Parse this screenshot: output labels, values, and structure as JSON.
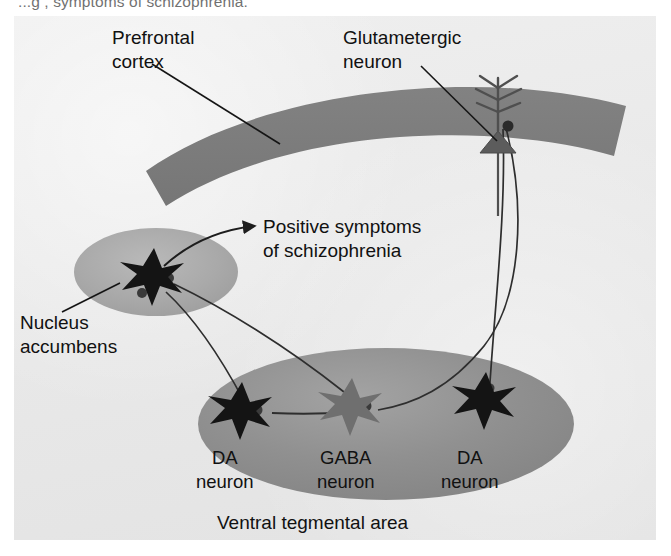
{
  "caption": {
    "clipped_line": "...g           , symptoms of schizophrenia."
  },
  "figure": {
    "labels": {
      "prefrontal_cortex": [
        "Prefrontal",
        "cortex"
      ],
      "glutametergic_neuron": [
        "Glutametergic",
        "neuron"
      ],
      "positive_symptoms": [
        "Positive symptoms",
        "of schizophrenia"
      ],
      "nucleus_accumbens": [
        "Nucleus",
        "accumbens"
      ],
      "da_neuron_left": [
        "DA",
        "neuron"
      ],
      "gaba_neuron": [
        "GABA",
        "neuron"
      ],
      "da_neuron_right": [
        "DA",
        "neuron"
      ],
      "ventral_tegmental_area": "Ventral tegmental area"
    },
    "structures": [
      {
        "name": "prefrontal-cortex-band",
        "kind": "curved-band",
        "fill": "#7d7d7d"
      },
      {
        "name": "nucleus-accumbens-ellipse",
        "kind": "ellipse",
        "fill": "#a8a8a8"
      },
      {
        "name": "ventral-tegmental-area-ellipse",
        "kind": "ellipse",
        "fill": "#8f8f8f"
      }
    ],
    "neurons": [
      {
        "name": "glutametergic-pyramidal-neuron",
        "shape": "triangle-with-dendrites",
        "fill": "#5a5a5a",
        "region": "prefrontal cortex"
      },
      {
        "name": "accumbens-star-neuron",
        "shape": "star",
        "fill": "#141414",
        "region": "nucleus accumbens"
      },
      {
        "name": "da-neuron-left-star",
        "shape": "star",
        "fill": "#141414",
        "region": "ventral tegmental area"
      },
      {
        "name": "gaba-neuron-star",
        "shape": "star",
        "fill": "#6f6f6f",
        "region": "ventral tegmental area"
      },
      {
        "name": "da-neuron-right-star",
        "shape": "star",
        "fill": "#141414",
        "region": "ventral tegmental area"
      }
    ],
    "connections": [
      {
        "name": "glutamate-axon-to-da-right",
        "from": "glutametergic-pyramidal-neuron",
        "to": "da-neuron-right-star"
      },
      {
        "name": "glutamate-axon-to-gaba",
        "from": "glutametergic-pyramidal-neuron",
        "to": "gaba-neuron-star"
      },
      {
        "name": "gaba-axon-to-da-left",
        "from": "gaba-neuron-star",
        "to": "da-neuron-left-star"
      },
      {
        "name": "da-left-axon-to-accumbens",
        "from": "da-neuron-left-star",
        "to": "accumbens-star-neuron"
      },
      {
        "name": "da-right-axon-to-accumbens",
        "from": "da-neuron-right-star",
        "to": "accumbens-star-neuron"
      },
      {
        "name": "positive-symptoms-arrow",
        "from": "accumbens-star-neuron",
        "to": "positive-symptoms-label"
      }
    ],
    "leaders": [
      {
        "name": "leader-prefrontal-cortex",
        "to": "prefrontal-cortex-band"
      },
      {
        "name": "leader-glutametergic-neuron",
        "to": "glutametergic-pyramidal-neuron"
      },
      {
        "name": "leader-nucleus-accumbens",
        "to": "nucleus-accumbens-ellipse"
      }
    ],
    "colors": {
      "panel_background": "#ebebeb",
      "cortex_gray": "#7d7d7d",
      "accumbens_gray": "#a8a8a8",
      "vta_gray": "#8f8f8f",
      "neuron_black": "#141414",
      "neuron_gray": "#6f6f6f",
      "text": "#111111",
      "line": "#2b2b2b"
    }
  }
}
